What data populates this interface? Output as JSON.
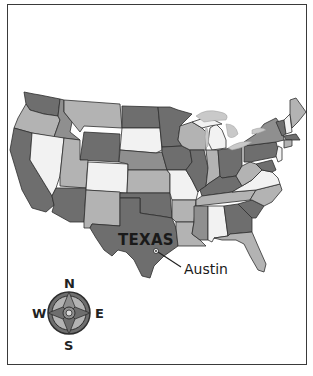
{
  "map": {
    "title": "United States map highlighting Texas",
    "highlighted_state": {
      "label": "TEXAS",
      "capital": {
        "label": "Austin",
        "marker": "star-circle-icon"
      }
    },
    "compass": {
      "north": "N",
      "south": "S",
      "east": "E",
      "west": "W"
    },
    "colors": {
      "dark": "#6e6e6e",
      "medium": "#8f8f8f",
      "light": "#b3b3b3",
      "lightest": "#f2f2f2",
      "border": "#2f2f2f",
      "lake": "#c9c9c9"
    }
  }
}
